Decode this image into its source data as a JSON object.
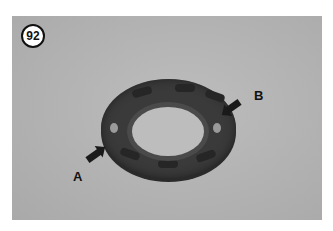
{
  "figure": {
    "number": "92",
    "callouts": [
      {
        "letter": "A"
      },
      {
        "letter": "B"
      }
    ],
    "colors": {
      "photo_background": "#b3b3b3",
      "part": "#3a3a3a",
      "badge_border": "#111111"
    }
  }
}
